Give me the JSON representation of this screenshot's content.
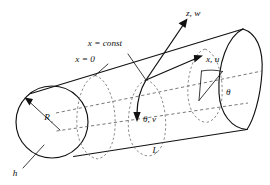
{
  "figure": {
    "background_color": "#ffffff",
    "line_color": "#111111",
    "dashed_color": "#555555"
  },
  "labels": {
    "axis_z": "z, w",
    "axis_x": "x, u",
    "axis_theta": "θ, v",
    "angle_theta": "θ",
    "x_zero": "x = 0",
    "x_const": "x = const",
    "radius": "R",
    "thickness": "h",
    "length": "L"
  },
  "geometry": {
    "left_cap_center_x": 52,
    "left_cap_center_y": 122,
    "left_cap_radius": 36,
    "origin_x": 146,
    "origin_y": 80,
    "cylinder_length_label": "L"
  },
  "icons": {
    "z_arrow": "arrow-up-right-icon",
    "x_arrow": "arrow-right-icon",
    "theta_arrow": "arrow-down-icon",
    "radius_arrow": "arrow-upleft-icon",
    "angle_arc": "arc-icon"
  }
}
